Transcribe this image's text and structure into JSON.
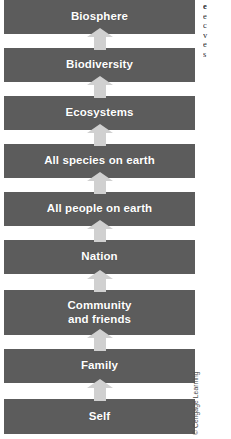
{
  "figure": {
    "type": "stacked-hierarchy-diagram",
    "orientation": "vertical-bottom-to-top",
    "bar_color": "#5c5c5c",
    "arrow_color": "#d0d0d0",
    "label_color": "#ffffff",
    "background": "#ffffff",
    "credit": "© Cengage Learning",
    "levels": [
      {
        "label": "Biosphere",
        "order_from_top": 1,
        "order_from_bottom": 9,
        "top": 0,
        "height": 34
      },
      {
        "label": "Biodiversity",
        "order_from_top": 2,
        "order_from_bottom": 8,
        "top": 48,
        "height": 34
      },
      {
        "label": "Ecosystems",
        "order_from_top": 3,
        "order_from_bottom": 7,
        "top": 96,
        "height": 34
      },
      {
        "label": "All species on earth",
        "order_from_top": 4,
        "order_from_bottom": 6,
        "top": 144,
        "height": 34
      },
      {
        "label": "All people on earth",
        "order_from_top": 5,
        "order_from_bottom": 5,
        "top": 192,
        "height": 34
      },
      {
        "label": "Nation",
        "order_from_top": 6,
        "order_from_bottom": 4,
        "top": 240,
        "height": 34
      },
      {
        "label": "Community\nand friends",
        "order_from_top": 7,
        "order_from_bottom": 3,
        "top": 290,
        "height": 45
      },
      {
        "label": "Family",
        "order_from_top": 8,
        "order_from_bottom": 2,
        "top": 349,
        "height": 34
      },
      {
        "label": "Self",
        "order_from_top": 9,
        "order_from_bottom": 1,
        "top": 399,
        "height": 35
      }
    ],
    "arrows": [
      {
        "from": "Biodiversity",
        "to": "Biosphere",
        "top": 28,
        "height": 22
      },
      {
        "from": "Ecosystems",
        "to": "Biodiversity",
        "top": 76,
        "height": 22
      },
      {
        "from": "All species on earth",
        "to": "Ecosystems",
        "top": 124,
        "height": 22
      },
      {
        "from": "All people on earth",
        "to": "All species on earth",
        "top": 172,
        "height": 22
      },
      {
        "from": "Nation",
        "to": "All people on earth",
        "top": 220,
        "height": 22
      },
      {
        "from": "Community and friends",
        "to": "Nation",
        "top": 270,
        "height": 22
      },
      {
        "from": "Family",
        "to": "Community and friends",
        "top": 329,
        "height": 22
      },
      {
        "from": "Self",
        "to": "Family",
        "top": 379,
        "height": 22
      }
    ]
  },
  "margin_note": {
    "lines": [
      "e",
      "e",
      "c",
      "v",
      "e",
      "s"
    ]
  }
}
